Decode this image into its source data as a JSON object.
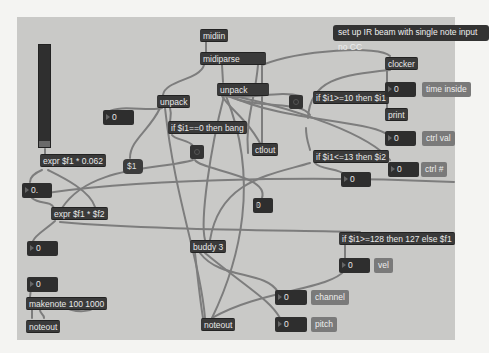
{
  "window": {
    "type": "Max/MSP patcher",
    "background": "#c9c9c7"
  },
  "comment": "set up IR beam with single note input no CC",
  "objects": {
    "midiin": "midiin",
    "midiparse": "midiparse",
    "unpack_left": "unpack",
    "unpack_right": "unpack",
    "if_zero_bang": "if $i1==0 then bang",
    "ctlout": "ctlout",
    "clocker": "clocker",
    "print": "print",
    "if_ge10": "if $i1>=10 then $i1",
    "if_le13": "if $i1<=13 then $i2",
    "expr_scale": "expr $f1 * 0.062",
    "expr_mult": "expr $f1 * $f2",
    "buddy": "buddy 3",
    "if_clip128": "if $i1>=128 then 127 else $f1",
    "makenote": "makenote 100 1000",
    "noteout_left": "noteout",
    "noteout_main": "noteout"
  },
  "message_boxes": {
    "dollar_one": "$1"
  },
  "number_boxes": {
    "unpack_out": "0",
    "time_inside": "0",
    "ctrl_val": "0",
    "ctrl_num": "0",
    "float_out": "0.",
    "if_le13_out": "0",
    "mid_small": "0",
    "expr_out": "0",
    "vel": "0",
    "makenote_in": "0",
    "channel": "0",
    "pitch": "0"
  },
  "labels": {
    "time_inside": "time inside",
    "ctrl_val": "ctrl val",
    "ctrl_num": "ctrl #",
    "vel": "vel",
    "channel": "channel",
    "pitch": "pitch"
  },
  "colors": {
    "object_bg": "#3a3a3a",
    "wire": "#7d7d7d",
    "label_bg": "#7a7a7a",
    "page_bg": "#f4f4f2"
  }
}
